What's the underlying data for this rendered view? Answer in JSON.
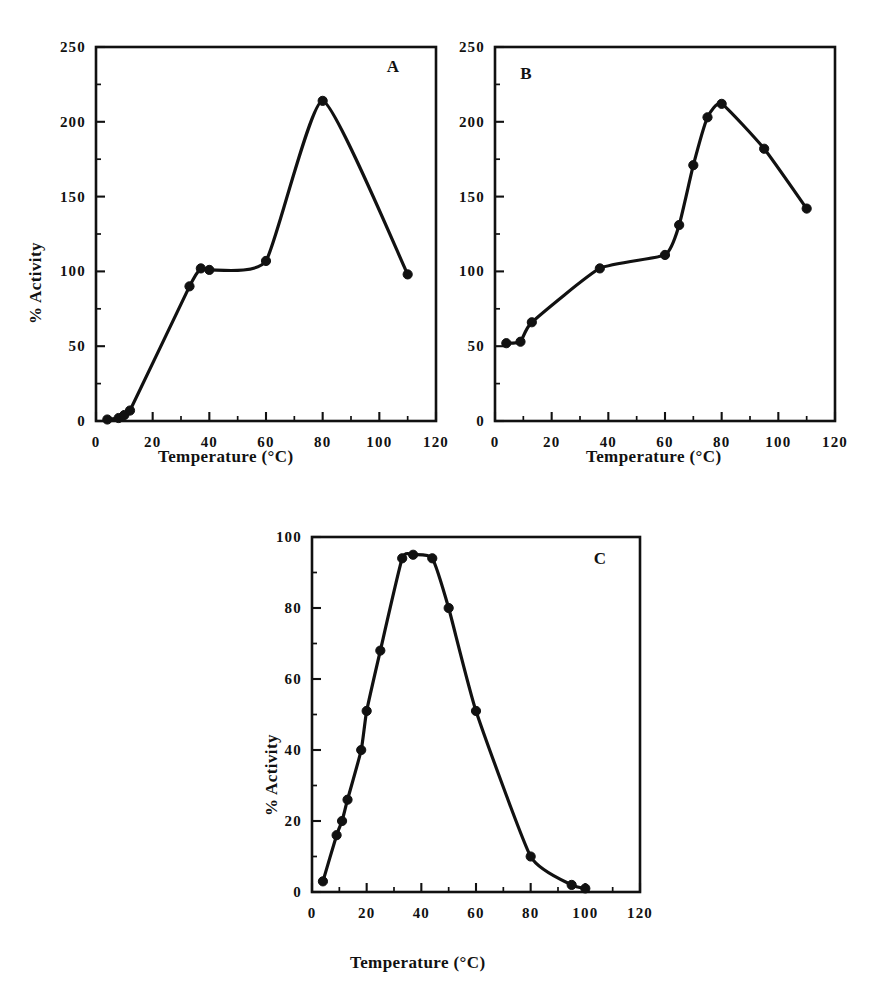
{
  "figure": {
    "background": "#ffffff",
    "ink_color": "#111111",
    "panel_letters": [
      "A",
      "B",
      "C"
    ],
    "shared_xlabel": "Temperature (°C)",
    "shared_ylabel": "% Activity"
  },
  "chart_data": [
    {
      "id": "panel-a",
      "type": "line",
      "title": "A",
      "panel_label": "A",
      "xlabel": "Temperature (°C)",
      "ylabel": "% Activity",
      "xlim": [
        0,
        120
      ],
      "ylim": [
        0,
        250
      ],
      "xticks": [
        0,
        20,
        40,
        60,
        80,
        100,
        120
      ],
      "xtick_labels": [
        "0",
        "20",
        "40",
        "60",
        "80",
        "100",
        "120"
      ],
      "yticks": [
        0,
        50,
        100,
        150,
        200,
        250
      ],
      "ytick_labels": [
        "0",
        "50",
        "100",
        "150",
        "200",
        "250"
      ],
      "x_minor_step": 10,
      "y_minor_step": 25,
      "grid": false,
      "legend": "none",
      "marker": "filled-circle",
      "x": [
        4,
        8,
        10,
        12,
        33,
        37,
        40,
        60,
        80,
        110
      ],
      "y": [
        1,
        2,
        4,
        7,
        90,
        102,
        101,
        107,
        214,
        98
      ],
      "values": [
        {
          "temperature": 4,
          "activity": 1
        },
        {
          "temperature": 8,
          "activity": 2
        },
        {
          "temperature": 10,
          "activity": 4
        },
        {
          "temperature": 12,
          "activity": 7
        },
        {
          "temperature": 33,
          "activity": 90
        },
        {
          "temperature": 37,
          "activity": 102
        },
        {
          "temperature": 40,
          "activity": 101
        },
        {
          "temperature": 60,
          "activity": 107
        },
        {
          "temperature": 80,
          "activity": 214
        },
        {
          "temperature": 110,
          "activity": 98
        }
      ]
    },
    {
      "id": "panel-b",
      "type": "line",
      "title": "B",
      "panel_label": "B",
      "xlabel": "Temperature (°C)",
      "ylabel": "% Activity",
      "xlim": [
        0,
        120
      ],
      "ylim": [
        0,
        250
      ],
      "xticks": [
        0,
        20,
        40,
        60,
        80,
        100,
        120
      ],
      "xtick_labels": [
        "0",
        "20",
        "40",
        "60",
        "80",
        "100",
        "120"
      ],
      "yticks": [
        0,
        50,
        100,
        150,
        200,
        250
      ],
      "ytick_labels": [
        "0",
        "50",
        "100",
        "150",
        "200",
        "250"
      ],
      "x_minor_step": 10,
      "y_minor_step": 25,
      "grid": false,
      "legend": "none",
      "marker": "filled-circle",
      "x": [
        4,
        9,
        13,
        37,
        60,
        65,
        70,
        75,
        80,
        95,
        110
      ],
      "y": [
        52,
        53,
        66,
        102,
        111,
        131,
        171,
        203,
        212,
        182,
        142
      ],
      "values": [
        {
          "temperature": 4,
          "activity": 52
        },
        {
          "temperature": 9,
          "activity": 53
        },
        {
          "temperature": 13,
          "activity": 66
        },
        {
          "temperature": 37,
          "activity": 102
        },
        {
          "temperature": 60,
          "activity": 111
        },
        {
          "temperature": 65,
          "activity": 131
        },
        {
          "temperature": 70,
          "activity": 171
        },
        {
          "temperature": 75,
          "activity": 203
        },
        {
          "temperature": 80,
          "activity": 212
        },
        {
          "temperature": 95,
          "activity": 182
        },
        {
          "temperature": 110,
          "activity": 142
        }
      ]
    },
    {
      "id": "panel-c",
      "type": "line",
      "title": "C",
      "panel_label": "C",
      "xlabel": "Temperature (°C)",
      "ylabel": "% Activity",
      "xlim": [
        0,
        120
      ],
      "ylim": [
        0,
        100
      ],
      "xticks": [
        0,
        20,
        40,
        60,
        80,
        100,
        120
      ],
      "xtick_labels": [
        "0",
        "20",
        "40",
        "60",
        "80",
        "100",
        "120"
      ],
      "yticks": [
        0,
        20,
        40,
        60,
        80,
        100
      ],
      "ytick_labels": [
        "0",
        "20",
        "40",
        "60",
        "80",
        "100"
      ],
      "x_minor_step": 10,
      "y_minor_step": 10,
      "grid": false,
      "legend": "none",
      "marker": "filled-circle",
      "x": [
        4,
        9,
        11,
        13,
        18,
        20,
        25,
        33,
        37,
        44,
        50,
        60,
        80,
        95,
        100
      ],
      "y": [
        3,
        16,
        20,
        26,
        40,
        51,
        68,
        94,
        95,
        94,
        80,
        51,
        10,
        2,
        1
      ],
      "values": [
        {
          "temperature": 4,
          "activity": 3
        },
        {
          "temperature": 9,
          "activity": 16
        },
        {
          "temperature": 11,
          "activity": 20
        },
        {
          "temperature": 13,
          "activity": 26
        },
        {
          "temperature": 18,
          "activity": 40
        },
        {
          "temperature": 20,
          "activity": 51
        },
        {
          "temperature": 25,
          "activity": 68
        },
        {
          "temperature": 33,
          "activity": 94
        },
        {
          "temperature": 37,
          "activity": 95
        },
        {
          "temperature": 44,
          "activity": 94
        },
        {
          "temperature": 50,
          "activity": 80
        },
        {
          "temperature": 60,
          "activity": 51
        },
        {
          "temperature": 80,
          "activity": 10
        },
        {
          "temperature": 95,
          "activity": 2
        },
        {
          "temperature": 100,
          "activity": 1
        }
      ]
    }
  ]
}
